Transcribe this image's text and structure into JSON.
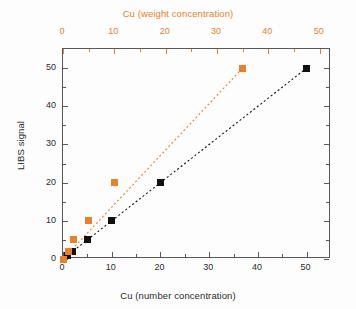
{
  "figure": {
    "width": 356,
    "height": 309,
    "background": "#fdfdfd"
  },
  "colors": {
    "number_concentration": "#111111",
    "weight_concentration": "#e8812c",
    "axis": "#58585a",
    "text": "#2b2b2b"
  },
  "axes": {
    "top": {
      "title": "Cu (weight concentration)",
      "color": "#e8812c",
      "ticks": [
        0,
        10,
        20,
        30,
        40,
        50
      ],
      "range": [
        0,
        52.2
      ]
    },
    "bottom": {
      "title": "Cu (number concentration)",
      "color": "#2b2b2b",
      "ticks": [
        0,
        10,
        20,
        30,
        40,
        50
      ],
      "range": [
        0,
        55
      ]
    },
    "left": {
      "title": "LIBS signal",
      "color": "#2b2b2b",
      "ticks": [
        0,
        10,
        20,
        30,
        40,
        50
      ],
      "range": [
        0,
        55
      ]
    }
  },
  "chart_data": {
    "type": "scatter",
    "title": "",
    "subtitle": "",
    "xlabel": "Cu (number concentration)",
    "ylabel": "LIBS signal",
    "xlabel_top": "Cu (weight concentration)",
    "xlim": [
      0,
      55
    ],
    "ylim": [
      0,
      55
    ],
    "xlim_top": [
      0,
      52.2
    ],
    "grid": false,
    "legend": "none",
    "series": [
      {
        "name": "Cu (number concentration)",
        "color": "#111111",
        "marker": "filled-square",
        "axis": "bottom",
        "trendline": "dashed",
        "x": [
          0,
          1,
          2,
          5,
          10,
          20,
          50
        ],
        "y": [
          0,
          1,
          2,
          5,
          10,
          20,
          50
        ]
      },
      {
        "name": "Cu (weight concentration)",
        "color": "#e8812c",
        "marker": "filled-square",
        "axis": "top",
        "trendline": "dashed",
        "x": [
          0,
          1,
          2,
          5,
          10,
          35
        ],
        "y": [
          0,
          2,
          5,
          10,
          20,
          50
        ]
      }
    ],
    "annotations": []
  }
}
